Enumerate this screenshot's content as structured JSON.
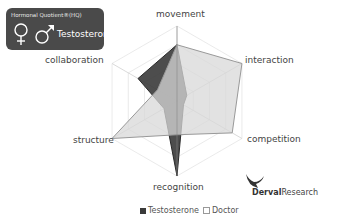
{
  "badge": {
    "title": "Hormonal Quotient®(HQ)",
    "label": "Testosterone",
    "icons": [
      "female-symbol-icon",
      "male-symbol-icon"
    ]
  },
  "legend": {
    "items": [
      {
        "label": "Testosterone",
        "color": "#3a3a3a"
      },
      {
        "label": "Doctor",
        "color": "#d8d8d8"
      }
    ]
  },
  "logo": {
    "bold": "Derval",
    "rest": "Research"
  },
  "chart_data": {
    "type": "radar",
    "title": "",
    "axes": [
      "movement",
      "interaction",
      "competition",
      "recognition",
      "structure",
      "collaboration"
    ],
    "series": [
      {
        "name": "Testosterone",
        "values": [
          0.75,
          0.15,
          0.1,
          1.0,
          0.2,
          0.6
        ],
        "color": "#3a3a3a"
      },
      {
        "name": "Doctor",
        "values": [
          0.75,
          1.0,
          0.85,
          0.45,
          1.0,
          0.3
        ],
        "color": "#d8d8d8"
      }
    ],
    "range": [
      0,
      1
    ],
    "grid_levels": 4,
    "legend_position": "bottom"
  }
}
